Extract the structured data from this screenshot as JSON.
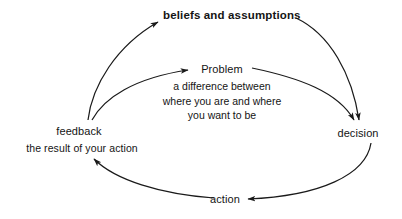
{
  "diagram": {
    "stroke_color": "#1a1a1a",
    "text_color": "#141414",
    "background": "#ffffff",
    "nodes": {
      "beliefs": {
        "label": "beliefs and assumptions",
        "emphasis": "bold"
      },
      "problem": {
        "label": "Problem",
        "description_lines": [
          "a difference between",
          "where you are and where",
          "you want to be"
        ]
      },
      "decision": {
        "label": "decision"
      },
      "action": {
        "label": "action"
      },
      "feedback": {
        "label": "feedback",
        "description": "the result of your action"
      }
    },
    "edges": [
      {
        "name": "feedback-to-beliefs",
        "from": "feedback",
        "to": "beliefs",
        "arrow": "end"
      },
      {
        "name": "feedback-to-problem",
        "from": "feedback",
        "to": "problem",
        "arrow": "end"
      },
      {
        "name": "beliefs-to-decision",
        "from": "beliefs",
        "to": "decision",
        "arrow": "end"
      },
      {
        "name": "problem-to-decision",
        "from": "problem",
        "to": "decision",
        "arrow": "end"
      },
      {
        "name": "decision-to-action",
        "from": "decision",
        "to": "action",
        "arrow": "end"
      },
      {
        "name": "action-to-feedback",
        "from": "action",
        "to": "feedback",
        "arrow": "end"
      }
    ]
  }
}
